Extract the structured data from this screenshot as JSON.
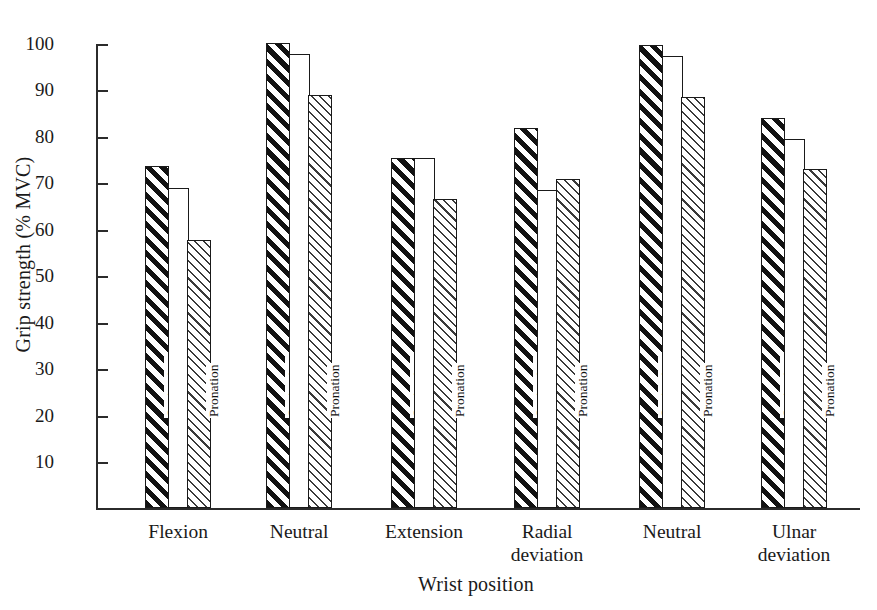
{
  "chart_data": {
    "type": "bar",
    "title": "",
    "xlabel": "Wrist position",
    "ylabel": "Grip strength (% MVC)",
    "ylim": [
      0,
      100
    ],
    "yticks": [
      10,
      20,
      30,
      40,
      50,
      60,
      70,
      80,
      90,
      100
    ],
    "ytick_labels": [
      "10",
      "20",
      "30",
      "40",
      "50",
      "60",
      "70",
      "80",
      "90",
      "100"
    ],
    "grid": false,
    "legend": "in-bar rotated labels",
    "categories": [
      "Flexion",
      "Neutral",
      "Extension",
      "Radial\ndeviation",
      "Neutral",
      "Ulnar\ndeviation"
    ],
    "series": [
      {
        "name": "Supination",
        "fill": "bold-diagonal-hatch",
        "values": [
          73.8,
          100.3,
          75.4,
          82.0,
          99.8,
          84.2
        ]
      },
      {
        "name": "Mid-position",
        "fill": "white-outline",
        "values": [
          69.0,
          98.0,
          75.4,
          68.7,
          97.5,
          79.5
        ]
      },
      {
        "name": "Pronation",
        "fill": "fine-diagonal-hatch",
        "values": [
          57.9,
          89.0,
          66.7,
          71.0,
          88.6,
          73.2
        ]
      }
    ]
  },
  "axis": {
    "y_label": "Grip strength (% MVC)",
    "x_label": "Wrist position",
    "y_ticks": [
      "100",
      "90",
      "80",
      "70",
      "60",
      "50",
      "40",
      "30",
      "20",
      "10"
    ]
  },
  "series_labels": [
    "Supination",
    "Mid-position",
    "Pronation"
  ],
  "category_labels": [
    "Flexion",
    "Neutral",
    "Extension",
    "Radial\ndeviation",
    "Neutral",
    "Ulnar\ndeviation"
  ],
  "colors": {
    "axis": "#2b2b2b",
    "hatch": "#121212",
    "fine_hatch": "#3a3a3a",
    "background": "#ffffff",
    "text": "#1a1a1a"
  }
}
